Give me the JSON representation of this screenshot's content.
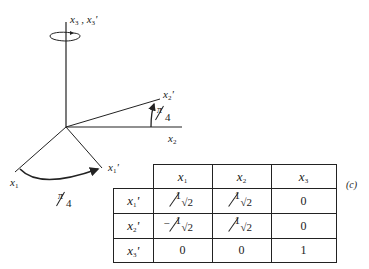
{
  "figure": {
    "caption": "(c)",
    "axis_labels": {
      "x3_pair": "x3 , x3'",
      "x2_prime": "x2'",
      "x2": "x2",
      "x1": "x1",
      "x1_prime": "x1'"
    },
    "angles": {
      "upper": "π/4",
      "lower": "π/4"
    }
  },
  "table": {
    "col_headers": [
      "x1",
      "x2",
      "x3"
    ],
    "row_headers": [
      "x1'",
      "x2'",
      "x3'"
    ],
    "rows": [
      [
        "1/√2",
        "1/√2",
        "0"
      ],
      [
        "-1/√2",
        "1/√2",
        "0"
      ],
      [
        "0",
        "0",
        "1"
      ]
    ]
  }
}
